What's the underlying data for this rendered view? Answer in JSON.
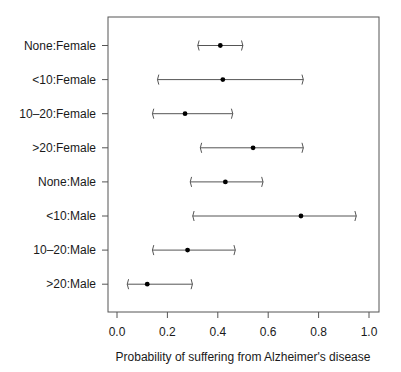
{
  "chart_data": {
    "type": "scatter",
    "subtype": "forest-plot / interval plot with point estimates",
    "title": "",
    "xlabel": "Probability of suffering from Alzheimer's disease",
    "ylabel": "",
    "xlim": [
      0.0,
      1.0
    ],
    "x_ticks": [
      "0.0",
      "0.2",
      "0.4",
      "0.6",
      "0.8",
      "1.0"
    ],
    "grid": false,
    "legend": null,
    "categories": [
      "None:Female",
      "<10:Female",
      "10–20:Female",
      ">20:Female",
      "None:Male",
      "<10:Male",
      "10–20:Male",
      ">20:Male"
    ],
    "series": [
      {
        "name": "estimate",
        "values": [
          0.41,
          0.42,
          0.27,
          0.54,
          0.43,
          0.73,
          0.28,
          0.12
        ]
      },
      {
        "name": "lower",
        "values": [
          0.32,
          0.16,
          0.14,
          0.33,
          0.29,
          0.3,
          0.14,
          0.04
        ]
      },
      {
        "name": "upper",
        "values": [
          0.5,
          0.74,
          0.46,
          0.74,
          0.58,
          0.95,
          0.47,
          0.3
        ]
      }
    ]
  },
  "colors": {
    "axis": "#555555",
    "interval": "#555555",
    "point": "#000000",
    "text": "#1a1a1a"
  }
}
